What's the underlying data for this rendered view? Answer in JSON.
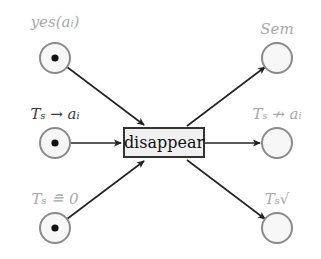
{
  "transition": {
    "label": "disappear"
  },
  "input_places": [
    {
      "label": "yes(a_i)",
      "display": "yes(aᵢ)",
      "token": true,
      "label_style": "dim"
    },
    {
      "label": "T_s → a_i",
      "display": "Tₛ → aᵢ",
      "token": true,
      "label_style": "dark"
    },
    {
      "label": "T_s ≘ 0",
      "display": "Tₛ ≘ 0",
      "token": true,
      "label_style": "dim"
    }
  ],
  "output_places": [
    {
      "label": "Sem",
      "display": "Sem",
      "token": false,
      "label_style": "dim"
    },
    {
      "label": "T_s ↛ a_i",
      "display": "Tₛ ↛ aᵢ",
      "token": false,
      "label_style": "dim"
    },
    {
      "label": "T_s √",
      "display": "Tₛ√",
      "token": false,
      "label_style": "dim"
    }
  ],
  "colors": {
    "arc": "#222222",
    "place_stroke": "#8a8a8a",
    "place_fill": "#f7f7f7",
    "token": "#111111",
    "transition_fill": "#f0f0f0",
    "transition_stroke": "#333333"
  }
}
